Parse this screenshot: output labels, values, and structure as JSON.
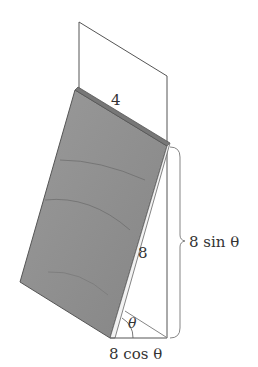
{
  "figure": {
    "labels": {
      "top_width": "4",
      "slant_length": "8",
      "angle": "θ",
      "height": "8 sin θ",
      "base": "8 cos θ"
    },
    "colors": {
      "panel_fill": "#8f8f8f",
      "panel_edge": "#555555",
      "line": "#555555",
      "text": "#333333"
    }
  }
}
